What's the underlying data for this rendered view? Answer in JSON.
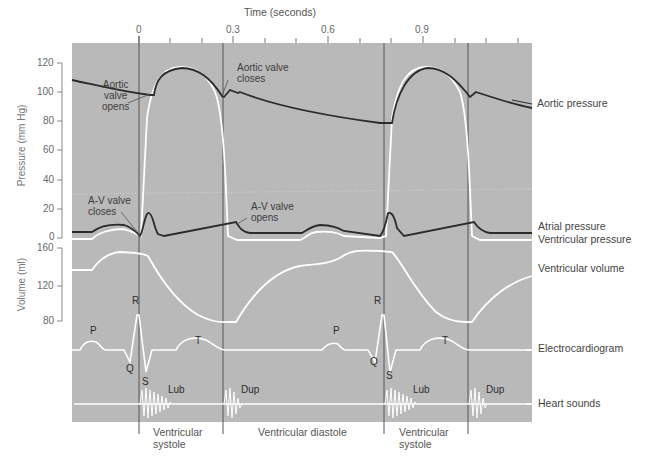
{
  "time_axis": {
    "title": "Time (seconds)",
    "ticks": [
      "0",
      "0.3",
      "0.6",
      "0.9"
    ]
  },
  "pressure_axis": {
    "title": "Pressure (mm Hg)",
    "ticks": [
      "120",
      "100",
      "80",
      "60",
      "40",
      "20",
      "0"
    ]
  },
  "volume_axis": {
    "title": "Volume (ml)",
    "ticks": [
      "160",
      "120",
      "80"
    ]
  },
  "annotations": {
    "aortic_opens": [
      "Aortic",
      "valve",
      "opens"
    ],
    "aortic_closes": [
      "Aortic valve",
      "closes"
    ],
    "av_closes": [
      "A-V valve",
      "closes"
    ],
    "av_opens": [
      "A-V valve",
      "opens"
    ]
  },
  "trace_labels": {
    "aortic_pressure": "Aortic pressure",
    "atrial_pressure": "Atrial pressure",
    "ventricular_pressure": "Ventricular pressure",
    "ventricular_volume": "Ventricular volume",
    "ecg": "Electrocardiogram",
    "heart_sounds": "Heart sounds"
  },
  "ecg_waves": {
    "p": "P",
    "q": "Q",
    "r": "R",
    "s": "S",
    "t": "T"
  },
  "sounds": {
    "lub": "Lub",
    "dup": "Dup"
  },
  "phases": {
    "systole_1": [
      "Ventricular",
      "systole"
    ],
    "diastole": "Ventricular diastole",
    "systole_2": [
      "Ventricular",
      "systole"
    ]
  },
  "colors": {
    "panel": "#b9b9b9",
    "dark_trace": "#2b2b2b",
    "white_trace": "#ffffff",
    "divider": "#555555"
  }
}
